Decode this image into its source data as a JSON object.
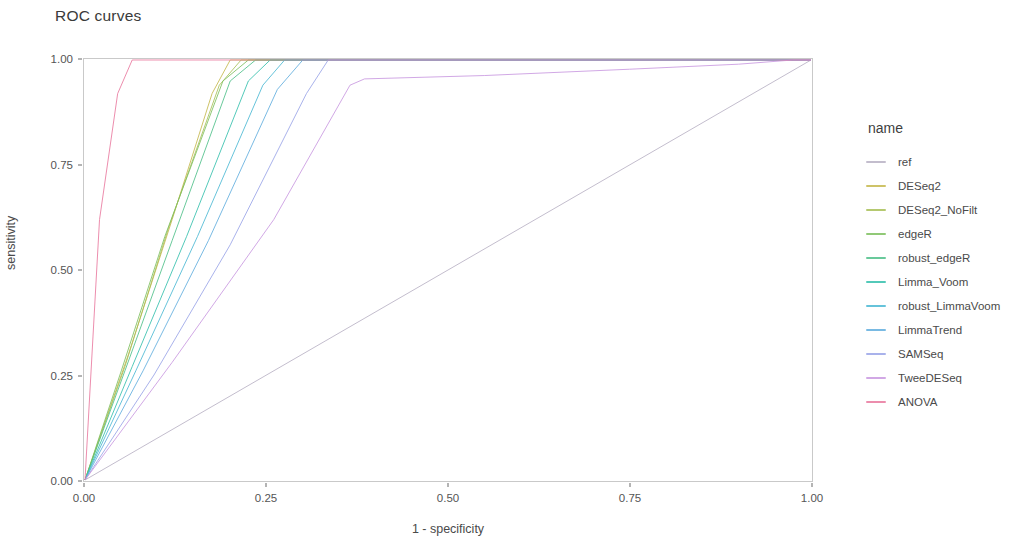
{
  "chart_data": {
    "type": "line",
    "title": "ROC curves",
    "xlabel": "1 - specificity",
    "ylabel": "sensitivity",
    "xlim": [
      0,
      1
    ],
    "ylim": [
      0,
      1
    ],
    "grid": false,
    "legend_position": "right",
    "legend_title": "name",
    "xticks": [
      "0.00",
      "0.25",
      "0.50",
      "0.75",
      "1.00"
    ],
    "xtick_values": [
      0,
      0.25,
      0.5,
      0.75,
      1
    ],
    "yticks": [
      "0.00",
      "0.25",
      "0.50",
      "0.75",
      "1.00"
    ],
    "ytick_values": [
      0,
      0.25,
      0.5,
      0.75,
      1
    ],
    "series": [
      {
        "name": "ref",
        "color": "#b8b1c4",
        "points": [
          [
            0,
            0
          ],
          [
            1,
            1
          ]
        ]
      },
      {
        "name": "DESeq2",
        "color": "#c6b84e",
        "points": [
          [
            0,
            0
          ],
          [
            0.06,
            0.3
          ],
          [
            0.12,
            0.62
          ],
          [
            0.175,
            0.92
          ],
          [
            0.2,
            1.0
          ],
          [
            1,
            1
          ]
        ]
      },
      {
        "name": "DESeq2_NoFilt",
        "color": "#a8bf57",
        "points": [
          [
            0,
            0
          ],
          [
            0.055,
            0.27
          ],
          [
            0.115,
            0.6
          ],
          [
            0.185,
            0.94
          ],
          [
            0.215,
            1.0
          ],
          [
            1,
            1
          ]
        ]
      },
      {
        "name": "edgeR",
        "color": "#7ec05f",
        "points": [
          [
            0,
            0
          ],
          [
            0.05,
            0.26
          ],
          [
            0.11,
            0.58
          ],
          [
            0.19,
            0.95
          ],
          [
            0.225,
            1.0
          ],
          [
            1,
            1
          ]
        ]
      },
      {
        "name": "robust_edgeR",
        "color": "#4fc08a",
        "points": [
          [
            0,
            0
          ],
          [
            0.055,
            0.26
          ],
          [
            0.12,
            0.57
          ],
          [
            0.2,
            0.95
          ],
          [
            0.235,
            1.0
          ],
          [
            1,
            1
          ]
        ]
      },
      {
        "name": "Limma_Voom",
        "color": "#35c0ad",
        "points": [
          [
            0,
            0
          ],
          [
            0.065,
            0.27
          ],
          [
            0.14,
            0.58
          ],
          [
            0.225,
            0.95
          ],
          [
            0.255,
            1.0
          ],
          [
            1,
            1
          ]
        ]
      },
      {
        "name": "robust_LimmaVoom",
        "color": "#4bb8d4",
        "points": [
          [
            0,
            0
          ],
          [
            0.07,
            0.26
          ],
          [
            0.155,
            0.58
          ],
          [
            0.245,
            0.94
          ],
          [
            0.275,
            1.0
          ],
          [
            1,
            1
          ]
        ]
      },
      {
        "name": "LimmaTrend",
        "color": "#62aede",
        "points": [
          [
            0,
            0
          ],
          [
            0.08,
            0.26
          ],
          [
            0.17,
            0.57
          ],
          [
            0.265,
            0.93
          ],
          [
            0.3,
            1.0
          ],
          [
            1,
            1
          ]
        ]
      },
      {
        "name": "SAMSeq",
        "color": "#9aa4e8",
        "points": [
          [
            0,
            0
          ],
          [
            0.095,
            0.25
          ],
          [
            0.2,
            0.56
          ],
          [
            0.305,
            0.92
          ],
          [
            0.335,
            1.0
          ],
          [
            1,
            1
          ]
        ]
      },
      {
        "name": "TweeDESeq",
        "color": "#c999e0",
        "points": [
          [
            0,
            0
          ],
          [
            0.12,
            0.28
          ],
          [
            0.26,
            0.62
          ],
          [
            0.365,
            0.94
          ],
          [
            0.385,
            0.955
          ],
          [
            0.55,
            0.963
          ],
          [
            0.75,
            0.978
          ],
          [
            0.9,
            0.99
          ],
          [
            0.975,
            1.0
          ],
          [
            1,
            1
          ]
        ]
      },
      {
        "name": "ANOVA",
        "color": "#e9799f",
        "points": [
          [
            0,
            0
          ],
          [
            0.02,
            0.62
          ],
          [
            0.045,
            0.92
          ],
          [
            0.065,
            1.0
          ],
          [
            1,
            1
          ]
        ]
      }
    ],
    "annotations": [
      "A faint light-gray diagonal reference line runs from (0,0) to (1,1).",
      "A pink line lies along sensitivity = 1.00 across the full x range.",
      "A blue curve plateaus near sensitivity 0.955 from x = 0.38 and rises slowly to 1.00 at x = 1.00."
    ]
  }
}
